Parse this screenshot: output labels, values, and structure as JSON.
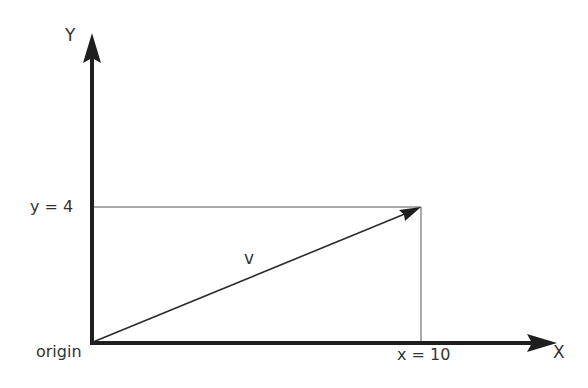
{
  "diagram": {
    "axes": {
      "y_label": "Y",
      "x_label": "X",
      "origin_label": "origin"
    },
    "vector": {
      "label": "v",
      "x": 10,
      "y": 4
    },
    "guides": {
      "y_value_label": "y = 4",
      "x_value_label": "x = 10"
    },
    "colors": {
      "axis": "#1f1f1f",
      "vector": "#2a2a2a",
      "guide": "#444444",
      "text": "#333333"
    }
  }
}
